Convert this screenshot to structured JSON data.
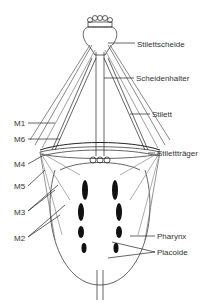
{
  "diagram": {
    "type": "anatomical",
    "labels_right": [
      {
        "id": "stilettscheide",
        "text": "Stilettscheide",
        "x": 137,
        "y": 40
      },
      {
        "id": "scheidenhalter",
        "text": "Scheidenhalter",
        "x": 136,
        "y": 75
      },
      {
        "id": "stilett",
        "text": "Stilett",
        "x": 152,
        "y": 111
      },
      {
        "id": "stilettraeger",
        "text": "Stilettträger",
        "x": 157,
        "y": 150
      },
      {
        "id": "pharynx",
        "text": "Pharynx",
        "x": 157,
        "y": 232
      },
      {
        "id": "placoide",
        "text": "Placoide",
        "x": 157,
        "y": 248
      }
    ],
    "labels_left": [
      {
        "id": "m1",
        "text": "M1",
        "x": 14,
        "y": 119
      },
      {
        "id": "m6",
        "text": "M6",
        "x": 14,
        "y": 135
      },
      {
        "id": "m4",
        "text": "M4",
        "x": 14,
        "y": 160
      },
      {
        "id": "m5",
        "text": "M5",
        "x": 14,
        "y": 182
      },
      {
        "id": "m3",
        "text": "M3",
        "x": 14,
        "y": 208
      },
      {
        "id": "m2",
        "text": "M2",
        "x": 14,
        "y": 234
      }
    ]
  }
}
